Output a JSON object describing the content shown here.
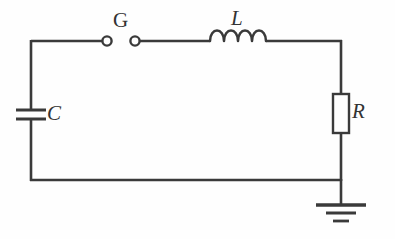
{
  "figure": {
    "name": "rlc-spark-gap-circuit",
    "type": "circuit-diagram",
    "width": 395,
    "height": 239,
    "background_color": "#fefefe",
    "line_color": "#3a3a3a"
  },
  "labels": {
    "spark_gap": "G",
    "inductor": "L",
    "capacitor": "C",
    "resistor": "R"
  },
  "components": {
    "spark_gap": {
      "name": "spark-gap",
      "label": "G",
      "style": "two-open-circles",
      "left_node": {
        "cx": 107,
        "cy": 41,
        "r": 4.6
      },
      "right_node": {
        "cx": 135,
        "cy": 41,
        "r": 4.6
      }
    },
    "inductor": {
      "name": "inductor",
      "label": "L",
      "style": "four-coil-humps",
      "coils": 4,
      "x_start": 210,
      "x_end": 266,
      "baseline_y": 41,
      "hump_height": 11
    },
    "capacitor": {
      "name": "capacitor",
      "label": "C",
      "style": "two-parallel-plates",
      "plate_top_y": 110,
      "plate_bottom_y": 119,
      "plate_x_start": 16,
      "plate_x_end": 46,
      "wire_x": 31
    },
    "resistor": {
      "name": "resistor",
      "label": "R",
      "style": "rectangle-box",
      "x": 333,
      "y": 94,
      "width": 16,
      "height": 39,
      "wire_x": 341
    },
    "ground": {
      "name": "ground",
      "style": "three-decreasing-bars",
      "stub_x": 341,
      "stub_top_y": 180,
      "stub_bottom_y": 205,
      "bars": [
        {
          "y": 205,
          "half_width": 25,
          "thickness": 3.4
        },
        {
          "y": 213,
          "half_width": 15,
          "thickness": 3.0
        },
        {
          "y": 221,
          "half_width": 8,
          "thickness": 2.8
        }
      ]
    }
  },
  "wires": {
    "left_rail_x": 31,
    "right_rail_x": 341,
    "top_rail_y": 41,
    "bottom_rail_y": 180,
    "segments": [
      {
        "name": "top-left-wire",
        "x1": 31,
        "y1": 41,
        "x2": 107,
        "y2": 41
      },
      {
        "name": "top-mid-wire",
        "x1": 135,
        "y1": 41,
        "x2": 210,
        "y2": 41
      },
      {
        "name": "top-right-wire",
        "x1": 266,
        "y1": 41,
        "x2": 341,
        "y2": 41
      },
      {
        "name": "left-rail-upper",
        "x1": 31,
        "y1": 41,
        "x2": 31,
        "y2": 110
      },
      {
        "name": "left-rail-lower",
        "x1": 31,
        "y1": 119,
        "x2": 31,
        "y2": 180
      },
      {
        "name": "bottom-wire",
        "x1": 31,
        "y1": 180,
        "x2": 341,
        "y2": 180
      },
      {
        "name": "right-rail-upper",
        "x1": 341,
        "y1": 41,
        "x2": 341,
        "y2": 94
      },
      {
        "name": "right-rail-lower",
        "x1": 341,
        "y1": 133,
        "x2": 341,
        "y2": 180
      },
      {
        "name": "ground-stub",
        "x1": 341,
        "y1": 180,
        "x2": 341,
        "y2": 205
      }
    ]
  }
}
